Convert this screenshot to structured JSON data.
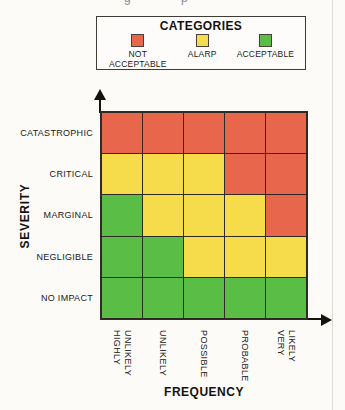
{
  "figure": {
    "background": "#fcfbf8"
  },
  "artifacts": {
    "top_fragments": [
      "g",
      "p"
    ]
  },
  "legend": {
    "title": "CATEGORIES",
    "items": [
      {
        "id": "not_acceptable",
        "label": "NOT ACCEPTABLE",
        "color": "#E8674C"
      },
      {
        "id": "alarp",
        "label": "ALARP",
        "color": "#F6DB4B"
      },
      {
        "id": "acceptable",
        "label": "ACCEPTABLE",
        "color": "#5ABD45"
      }
    ]
  },
  "chart_data": {
    "type": "heatmap",
    "xlabel": "FREQUENCY",
    "ylabel": "SEVERITY",
    "x_categories": [
      "HIGHLY\nUNLIKELY",
      "UNLIKELY",
      "POSSIBLE",
      "PROBABLE",
      "VERY LIKELY"
    ],
    "y_categories": [
      "CATASTROPHIC",
      "CRITICAL",
      "MARGINAL",
      "NEGLIGIBLE",
      "NO IMPACT"
    ],
    "cell_categories": [
      [
        "not_acceptable",
        "not_acceptable",
        "not_acceptable",
        "not_acceptable",
        "not_acceptable"
      ],
      [
        "alarp",
        "alarp",
        "alarp",
        "not_acceptable",
        "not_acceptable"
      ],
      [
        "acceptable",
        "alarp",
        "alarp",
        "alarp",
        "not_acceptable"
      ],
      [
        "acceptable",
        "acceptable",
        "alarp",
        "alarp",
        "alarp"
      ],
      [
        "acceptable",
        "acceptable",
        "acceptable",
        "acceptable",
        "acceptable"
      ]
    ],
    "category_colors": {
      "not_acceptable": "#E8674C",
      "alarp": "#F6DB4B",
      "acceptable": "#5ABD45"
    },
    "legend_position": "top",
    "grid": true
  }
}
